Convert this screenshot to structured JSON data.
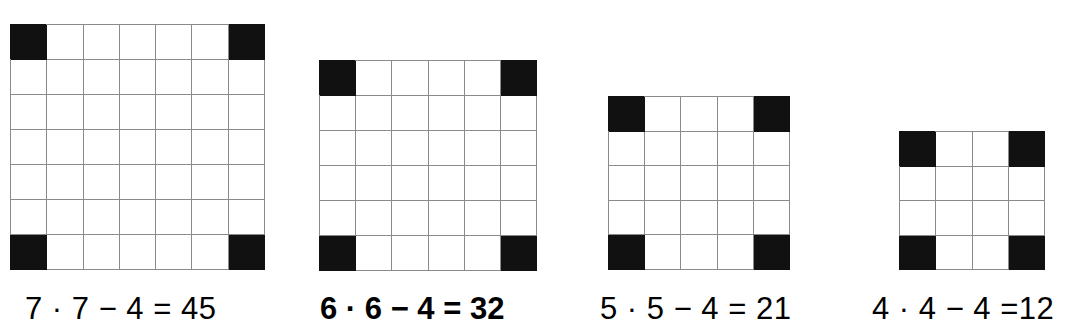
{
  "figure": {
    "background_color": "#ffffff",
    "grid_line_color": "#8a8a8a",
    "filled_cell_color": "#111111",
    "text_color": "#000000"
  },
  "panels": [
    {
      "id": "panel-7",
      "n": 7,
      "rows": 7,
      "cols": 7,
      "filled_cells": [
        [
          0,
          0
        ],
        [
          0,
          6
        ],
        [
          6,
          0
        ],
        [
          6,
          6
        ]
      ],
      "caption": "7 · 7 − 4 = 45",
      "caption_bold": false,
      "product": 49,
      "removed": 4,
      "result": 45,
      "geometry": {
        "x": 10,
        "y": 24,
        "width": 255,
        "height": 246,
        "cell": 36.4
      },
      "caption_geometry": {
        "x": 25,
        "y": 292
      }
    },
    {
      "id": "panel-6",
      "n": 6,
      "rows": 6,
      "cols": 6,
      "filled_cells": [
        [
          0,
          0
        ],
        [
          0,
          5
        ],
        [
          5,
          0
        ],
        [
          5,
          5
        ]
      ],
      "caption": "6 · 6 − 4 = 32",
      "caption_bold": true,
      "product": 36,
      "removed": 4,
      "result": 32,
      "geometry": {
        "x": 319,
        "y": 60,
        "width": 218,
        "height": 211,
        "cell": 36.3
      },
      "caption_geometry": {
        "x": 320,
        "y": 292
      }
    },
    {
      "id": "panel-5",
      "n": 5,
      "rows": 5,
      "cols": 5,
      "filled_cells": [
        [
          0,
          0
        ],
        [
          0,
          4
        ],
        [
          4,
          0
        ],
        [
          4,
          4
        ]
      ],
      "caption": "5 · 5 − 4 = 21",
      "caption_bold": false,
      "product": 25,
      "removed": 4,
      "result": 21,
      "geometry": {
        "x": 608,
        "y": 96,
        "width": 182,
        "height": 174,
        "cell": 36.4
      },
      "caption_geometry": {
        "x": 600,
        "y": 292
      }
    },
    {
      "id": "panel-4",
      "n": 4,
      "rows": 4,
      "cols": 4,
      "filled_cells": [
        [
          0,
          0
        ],
        [
          0,
          3
        ],
        [
          3,
          0
        ],
        [
          3,
          3
        ]
      ],
      "caption": "4 · 4 − 4 =12",
      "caption_bold": false,
      "product": 16,
      "removed": 4,
      "result": 12,
      "geometry": {
        "x": 899,
        "y": 131,
        "width": 146,
        "height": 139,
        "cell": 36.5
      },
      "caption_geometry": {
        "x": 872,
        "y": 292
      }
    }
  ],
  "chart_data": {
    "type": "table",
    "categories": [
      "7 × 7",
      "6 × 6",
      "5 × 5",
      "4 × 4"
    ],
    "values": [
      45,
      32,
      21,
      12
    ],
    "xlabel": "",
    "ylabel": "",
    "annotations": [
      "7 · 7 − 4 = 45",
      "6 · 6 − 4 = 32",
      "5 · 5 − 4 = 21",
      "4 · 4 − 4 =12"
    ],
    "legend": [],
    "grid": true
  }
}
